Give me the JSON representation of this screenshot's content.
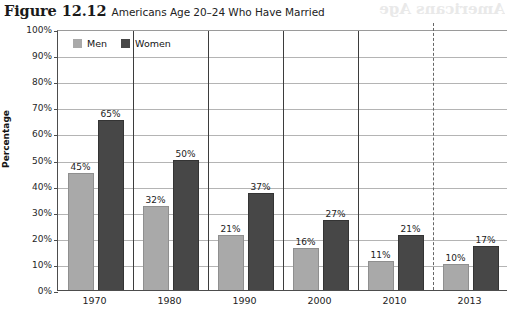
{
  "figure": {
    "number": "Figure 12.12",
    "title": "Americans Age 20–24 Who Have Married",
    "bleed_artifact": "Americans Age"
  },
  "chart_data": {
    "type": "bar",
    "title": "Americans Age 20–24 Who Have Married",
    "xlabel": "",
    "ylabel": "Percentage",
    "ylim": [
      0,
      100
    ],
    "ytick_labels": [
      "100%",
      "90%",
      "80%",
      "70%",
      "60%",
      "50%",
      "40%",
      "30%",
      "20%",
      "10%",
      "0%"
    ],
    "ytick_values": [
      100,
      90,
      80,
      70,
      60,
      50,
      40,
      30,
      20,
      10,
      0
    ],
    "grid": true,
    "legend_position": "top-left",
    "categories": [
      "1970",
      "1980",
      "1990",
      "2000",
      "2010",
      "2013"
    ],
    "series": [
      {
        "name": "Men",
        "color": "#a9a9a9",
        "values": [
          45,
          32,
          21,
          16,
          11,
          10
        ],
        "labels": [
          "45%",
          "32%",
          "21%",
          "16%",
          "11%",
          "10%"
        ]
      },
      {
        "name": "Women",
        "color": "#474747",
        "values": [
          65,
          50,
          37,
          27,
          21,
          17
        ],
        "labels": [
          "65%",
          "50%",
          "37%",
          "27%",
          "21%",
          "17%"
        ]
      }
    ],
    "annotations": [
      {
        "type": "vertical-dashed-divider",
        "after_category": "2010",
        "color": "#666666"
      }
    ]
  }
}
